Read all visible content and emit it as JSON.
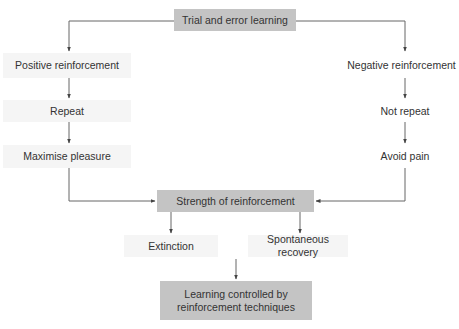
{
  "diagram": {
    "type": "flowchart",
    "nodes": {
      "root": {
        "label": "Trial and error learning"
      },
      "positive": {
        "label": "Positive reinforcement"
      },
      "repeat": {
        "label": "Repeat"
      },
      "pleasure": {
        "label": "Maximise pleasure"
      },
      "negative": {
        "label": "Negative reinforcement"
      },
      "not_repeat": {
        "label": "Not repeat"
      },
      "pain": {
        "label": "Avoid pain"
      },
      "strength": {
        "label": "Strength of reinforcement"
      },
      "extinction": {
        "label": "Extinction"
      },
      "recovery": {
        "label": "Spontaneous recovery"
      },
      "outcome": {
        "label_line1": "Learning controlled by",
        "label_line2": "reinforcement techniques"
      }
    },
    "edges": [
      {
        "from": "Trial and error learning",
        "to": "Positive reinforcement"
      },
      {
        "from": "Trial and error learning",
        "to": "Negative reinforcement"
      },
      {
        "from": "Positive reinforcement",
        "to": "Repeat"
      },
      {
        "from": "Repeat",
        "to": "Maximise pleasure"
      },
      {
        "from": "Negative reinforcement",
        "to": "Not repeat"
      },
      {
        "from": "Not repeat",
        "to": "Avoid pain"
      },
      {
        "from": "Maximise pleasure",
        "to": "Strength of reinforcement"
      },
      {
        "from": "Avoid pain",
        "to": "Strength of reinforcement"
      },
      {
        "from": "Strength of reinforcement",
        "to": "Extinction"
      },
      {
        "from": "Strength of reinforcement",
        "to": "Spontaneous recovery"
      },
      {
        "from": "Extinction / Spontaneous recovery",
        "to": "Learning controlled by reinforcement techniques"
      }
    ],
    "colors": {
      "dark_box": "#c4c4c4",
      "light_box": "#f5f5f5",
      "line": "#555555",
      "text": "#333333"
    }
  }
}
